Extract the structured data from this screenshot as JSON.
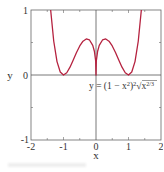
{
  "chart_data": {
    "type": "line",
    "title": "",
    "xlabel": "x",
    "ylabel": "y",
    "xlim": [
      -2,
      2
    ],
    "ylim": [
      -1,
      1
    ],
    "grid": false,
    "x_ticks": [
      "-2",
      "-1",
      "0",
      "1",
      "2"
    ],
    "y_ticks": [
      "-1",
      "0",
      "1"
    ],
    "annotation": "y = (1 − x²)²∛x^(2/3)",
    "annotation_parts": {
      "prefix": "y = (1 − x",
      "sup1": "2",
      "mid": ")",
      "sup2": "2",
      "root_index": "3",
      "radical": "√",
      "radicand": "x",
      "sup3": "2/3"
    },
    "series": [
      {
        "name": "y = (1 − x²)²∛x^(2/3)",
        "color": "#b5223f",
        "x": [
          -1.395,
          -1.3,
          -1.2,
          -1.1,
          -1.0,
          -0.9,
          -0.8,
          -0.7,
          -0.6,
          -0.5,
          -0.4,
          -0.3,
          -0.2,
          -0.1,
          -0.05,
          -0.01,
          0,
          0.01,
          0.05,
          0.1,
          0.2,
          0.3,
          0.4,
          0.5,
          0.6,
          0.7,
          0.8,
          0.9,
          1.0,
          1.1,
          1.2,
          1.3,
          1.395
        ],
        "y": [
          1.0,
          0.519,
          0.206,
          0.046,
          0.0,
          0.035,
          0.12,
          0.231,
          0.345,
          0.447,
          0.52,
          0.554,
          0.539,
          0.455,
          0.366,
          0.215,
          0.0,
          0.215,
          0.366,
          0.455,
          0.539,
          0.554,
          0.52,
          0.447,
          0.345,
          0.231,
          0.12,
          0.035,
          0.0,
          0.046,
          0.206,
          0.519,
          1.0
        ]
      }
    ],
    "axes_lines": {
      "x_axis_at_y": 0,
      "y_axis_at_x": 0,
      "color": "#555555"
    },
    "frame_color": "#666666"
  }
}
